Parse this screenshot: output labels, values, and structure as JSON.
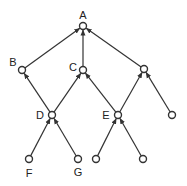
{
  "diagram": {
    "type": "directed-graph",
    "colors": {
      "stroke": "#333333",
      "node_fill": "#ffffff",
      "label": "#222222"
    },
    "nodes": [
      {
        "id": "A",
        "label": "A",
        "x": 83,
        "y": 26,
        "label_x": 83,
        "label_y": 15
      },
      {
        "id": "B",
        "label": "B",
        "x": 22,
        "y": 70,
        "label_x": 13,
        "label_y": 62
      },
      {
        "id": "C",
        "label": "C",
        "x": 83,
        "y": 70,
        "label_x": 73,
        "label_y": 67
      },
      {
        "id": "R",
        "label": "",
        "x": 144,
        "y": 69,
        "label_x": 0,
        "label_y": 0
      },
      {
        "id": "D",
        "label": "D",
        "x": 52,
        "y": 115,
        "label_x": 40,
        "label_y": 115
      },
      {
        "id": "E",
        "label": "E",
        "x": 118,
        "y": 115,
        "label_x": 106,
        "label_y": 115
      },
      {
        "id": "RL",
        "label": "",
        "x": 172,
        "y": 115,
        "label_x": 0,
        "label_y": 0
      },
      {
        "id": "F",
        "label": "F",
        "x": 29,
        "y": 159,
        "label_x": 29,
        "label_y": 173
      },
      {
        "id": "G",
        "label": "G",
        "x": 78,
        "y": 159,
        "label_x": 78,
        "label_y": 172
      },
      {
        "id": "EL",
        "label": "",
        "x": 96,
        "y": 159,
        "label_x": 0,
        "label_y": 0
      },
      {
        "id": "ER",
        "label": "",
        "x": 143,
        "y": 159,
        "label_x": 0,
        "label_y": 0
      }
    ],
    "edges": [
      {
        "from": "B",
        "to": "A"
      },
      {
        "from": "C",
        "to": "A"
      },
      {
        "from": "R",
        "to": "A"
      },
      {
        "from": "D",
        "to": "B"
      },
      {
        "from": "D",
        "to": "C"
      },
      {
        "from": "E",
        "to": "C"
      },
      {
        "from": "E",
        "to": "R"
      },
      {
        "from": "RL",
        "to": "R"
      },
      {
        "from": "F",
        "to": "D"
      },
      {
        "from": "G",
        "to": "D"
      },
      {
        "from": "EL",
        "to": "E"
      },
      {
        "from": "ER",
        "to": "E"
      }
    ]
  }
}
